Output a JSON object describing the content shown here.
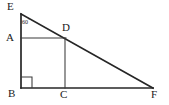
{
  "figure": {
    "type": "geometry-diagram",
    "background_color": "#ffffff",
    "stroke_color": "#262626",
    "text_color": "#1a1a1a",
    "width": 169,
    "height": 105
  },
  "points": {
    "E": {
      "label": "E",
      "x": 21,
      "y": 14,
      "label_x": 7,
      "label_y": 1
    },
    "A": {
      "label": "A",
      "x": 21,
      "y": 38,
      "label_x": 6,
      "label_y": 32
    },
    "B": {
      "label": "B",
      "x": 21,
      "y": 88,
      "label_x": 8,
      "label_y": 88
    },
    "C": {
      "label": "C",
      "x": 65,
      "y": 88,
      "label_x": 60,
      "label_y": 89
    },
    "D": {
      "label": "D",
      "x": 65,
      "y": 38,
      "label_x": 62,
      "label_y": 22
    },
    "F": {
      "label": "F",
      "x": 153,
      "y": 88,
      "label_x": 151,
      "label_y": 89
    }
  },
  "segments": [
    {
      "name": "segment-EB",
      "from": "E",
      "to": "B",
      "width": 1.6
    },
    {
      "name": "segment-BF",
      "from": "B",
      "to": "F",
      "width": 1.6
    },
    {
      "name": "segment-EF",
      "from": "E",
      "to": "F",
      "width": 1.6
    },
    {
      "name": "segment-AD",
      "from": "A",
      "to": "D",
      "width": 1.0
    },
    {
      "name": "segment-DC",
      "from": "D",
      "to": "C",
      "width": 1.0
    }
  ],
  "angles": [
    {
      "name": "angle-at-E",
      "vertex": "E",
      "value": "60",
      "degree_symbol": "°",
      "label_x": 22,
      "label_y": 17
    },
    {
      "name": "right-angle-at-B",
      "vertex": "B",
      "marker": "square",
      "size": 11
    }
  ]
}
